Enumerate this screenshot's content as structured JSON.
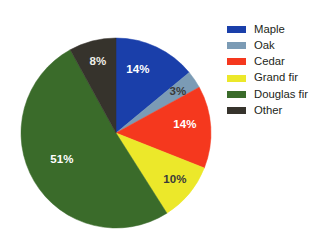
{
  "chart_data": {
    "type": "pie",
    "title": "",
    "subtitle": "",
    "xlabel": "",
    "ylabel": "",
    "legend_position": "right",
    "grid": false,
    "categories": [
      "Maple",
      "Oak",
      "Cedar",
      "Grand fir",
      "Douglas fir",
      "Other"
    ],
    "values": [
      14,
      3,
      14,
      10,
      51,
      8
    ],
    "value_unit": "%",
    "start_angle_deg": 0,
    "direction": "clockwise",
    "slices": [
      {
        "label": "Maple",
        "value": 14,
        "data_label": "14%",
        "color": "#1a3faa",
        "label_color": "#ffffff",
        "label_x": 138,
        "label_y": 70
      },
      {
        "label": "Oak",
        "value": 3,
        "data_label": "3%",
        "color": "#7b9bb5",
        "label_color": "#3a3a3a",
        "label_x": 178,
        "label_y": 92
      },
      {
        "label": "Cedar",
        "value": 14,
        "data_label": "14%",
        "color": "#f5381e",
        "label_color": "#ffffff",
        "label_x": 185,
        "label_y": 125
      },
      {
        "label": "Grand fir",
        "value": 10,
        "data_label": "10%",
        "color": "#ece82a",
        "label_color": "#3a3a3a",
        "label_x": 175,
        "label_y": 180
      },
      {
        "label": "Douglas fir",
        "value": 51,
        "data_label": "51%",
        "color": "#3a6b2a",
        "label_color": "#ffffff",
        "label_x": 62,
        "label_y": 160
      },
      {
        "label": "Other",
        "value": 8,
        "data_label": "8%",
        "color": "#36332c",
        "label_color": "#efefe8",
        "label_x": 98,
        "label_y": 62
      }
    ],
    "geometry": {
      "center_x": 116,
      "center_y": 133,
      "radius": 95
    }
  },
  "legend": {
    "items": [
      {
        "label": "Maple",
        "color": "#1a3faa"
      },
      {
        "label": "Oak",
        "color": "#7b9bb5"
      },
      {
        "label": "Cedar",
        "color": "#f5381e"
      },
      {
        "label": "Grand fir",
        "color": "#ece82a"
      },
      {
        "label": "Douglas fir",
        "color": "#3a6b2a"
      },
      {
        "label": "Other",
        "color": "#36332c"
      }
    ]
  },
  "colors": {
    "background": "#ffffff",
    "text": "#231f20",
    "maple": "#1a3faa",
    "oak": "#7b9bb5",
    "cedar": "#f5381e",
    "grand_fir": "#ece82a",
    "douglas_fir": "#3a6b2a",
    "other": "#36332c"
  }
}
